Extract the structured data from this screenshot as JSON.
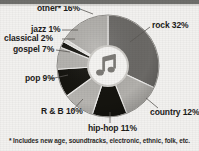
{
  "chart_data": {
    "type": "pie",
    "title": "",
    "subtitle": "",
    "xlabel": "",
    "ylabel": "",
    "legend_position": "callout-labels",
    "grid": false,
    "units": "percent",
    "total": 100,
    "start_angle_deg": 0,
    "direction": "clockwise",
    "categories": [
      "rock",
      "country",
      "hip-hop",
      "R & B",
      "pop",
      "gospel",
      "classical",
      "jazz",
      "other*"
    ],
    "values": [
      32,
      12,
      11,
      10,
      9,
      7,
      2,
      1,
      16
    ],
    "slices": [
      {
        "label": "rock",
        "value": 32,
        "label_text": "rock 32%",
        "color": "#6c6a67"
      },
      {
        "label": "country",
        "value": 12,
        "label_text": "country 12%",
        "color": "#b3b1ad"
      },
      {
        "label": "hip-hop",
        "value": 11,
        "label_text": "hip-hop 11%",
        "color": "#15140f"
      },
      {
        "label": "R & B",
        "value": 10,
        "label_text": "R & B 10%",
        "color": "#b8b6b2"
      },
      {
        "label": "pop",
        "value": 9,
        "label_text": "pop 9%",
        "color": "#15140f"
      },
      {
        "label": "gospel",
        "value": 7,
        "label_text": "gospel 7%",
        "color": "#b8b6b2"
      },
      {
        "label": "classical",
        "value": 2,
        "label_text": "classical 2%",
        "color": "#15140f"
      },
      {
        "label": "jazz",
        "value": 1,
        "label_text": "jazz 1%",
        "color": "#dedcd8"
      },
      {
        "label": "other*",
        "value": 16,
        "label_text": "other* 16%",
        "color": "#b3b1ad"
      }
    ],
    "footnote": "* Includes new age, soundtracks, electronic, ethnic, folk, etc.",
    "center_icon": "music-note-icon"
  },
  "labels": {
    "rock": "rock 32%",
    "country": "country 12%",
    "hiphop": "hip-hop 11%",
    "rnb": "R & B 10%",
    "pop": "pop 9%",
    "gospel": "gospel 7%",
    "classical": "classical 2%",
    "jazz": "jazz 1%",
    "other": "other* 16%"
  },
  "footnote": "* Includes new age, soundtracks, electronic, ethnic, folk, etc.",
  "colors": {
    "rock": "#6c6a67",
    "light_gray": "#b3b1ad",
    "black": "#15140f",
    "pale": "#dedcd8",
    "background": "#f2f1ef",
    "topbar": "#6f6f6c",
    "text": "#1c1b1a"
  }
}
